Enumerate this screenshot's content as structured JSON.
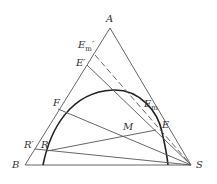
{
  "diagram": {
    "type": "ternary-phase-diagram",
    "vertices": {
      "top": "A",
      "bottom_left": "B",
      "bottom_right": "S"
    },
    "points": {
      "E_m_prime": {
        "label": "E",
        "sub": "m",
        "prime": "′"
      },
      "E_prime": {
        "label": "E′"
      },
      "E_m": {
        "label": "E",
        "sub": "m"
      },
      "E": {
        "label": "E"
      },
      "F": {
        "label": "F"
      },
      "M": {
        "label": "M"
      },
      "R": {
        "label": "R"
      },
      "R_prime": {
        "label": "R′"
      }
    },
    "colors": {
      "line": "#555555",
      "curve": "#222222",
      "text": "#333333"
    }
  }
}
